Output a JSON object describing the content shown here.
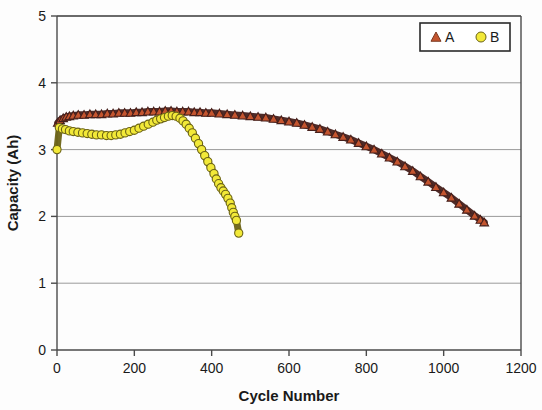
{
  "chart_data": {
    "type": "scatter",
    "title": "",
    "xlabel": "Cycle Number",
    "ylabel": "Capacity (Ah)",
    "xlim": [
      0,
      1200
    ],
    "ylim": [
      0,
      5
    ],
    "xticks": [
      0,
      200,
      400,
      600,
      800,
      1000,
      1200
    ],
    "yticks": [
      0,
      1,
      2,
      3,
      4,
      5
    ],
    "xtick_labels": [
      "0",
      "200",
      "400",
      "600",
      "800",
      "1000",
      "1200"
    ],
    "ytick_labels": [
      "0",
      "1",
      "2",
      "3",
      "4",
      "5"
    ],
    "grid": "horizontal",
    "legend_position": "top-right",
    "series": [
      {
        "name": "A",
        "marker": "triangle",
        "color": "#c4552f",
        "line_color": "#46201c",
        "points": [
          [
            2,
            3.4
          ],
          [
            8,
            3.44
          ],
          [
            16,
            3.47
          ],
          [
            24,
            3.49
          ],
          [
            32,
            3.5
          ],
          [
            42,
            3.51
          ],
          [
            55,
            3.52
          ],
          [
            70,
            3.52
          ],
          [
            85,
            3.53
          ],
          [
            100,
            3.53
          ],
          [
            115,
            3.53
          ],
          [
            130,
            3.54
          ],
          [
            145,
            3.54
          ],
          [
            160,
            3.55
          ],
          [
            175,
            3.55
          ],
          [
            190,
            3.55
          ],
          [
            205,
            3.56
          ],
          [
            220,
            3.56
          ],
          [
            235,
            3.57
          ],
          [
            250,
            3.57
          ],
          [
            265,
            3.57
          ],
          [
            280,
            3.58
          ],
          [
            295,
            3.58
          ],
          [
            310,
            3.57
          ],
          [
            325,
            3.57
          ],
          [
            340,
            3.57
          ],
          [
            355,
            3.56
          ],
          [
            370,
            3.56
          ],
          [
            385,
            3.55
          ],
          [
            400,
            3.55
          ],
          [
            420,
            3.54
          ],
          [
            440,
            3.53
          ],
          [
            460,
            3.52
          ],
          [
            480,
            3.51
          ],
          [
            500,
            3.5
          ],
          [
            520,
            3.49
          ],
          [
            540,
            3.48
          ],
          [
            560,
            3.46
          ],
          [
            580,
            3.44
          ],
          [
            600,
            3.42
          ],
          [
            620,
            3.4
          ],
          [
            640,
            3.37
          ],
          [
            660,
            3.34
          ],
          [
            680,
            3.31
          ],
          [
            700,
            3.27
          ],
          [
            720,
            3.23
          ],
          [
            740,
            3.19
          ],
          [
            760,
            3.15
          ],
          [
            780,
            3.1
          ],
          [
            800,
            3.05
          ],
          [
            820,
            3.0
          ],
          [
            840,
            2.94
          ],
          [
            860,
            2.88
          ],
          [
            880,
            2.82
          ],
          [
            900,
            2.75
          ],
          [
            920,
            2.68
          ],
          [
            940,
            2.6
          ],
          [
            960,
            2.52
          ],
          [
            980,
            2.44
          ],
          [
            1000,
            2.36
          ],
          [
            1020,
            2.28
          ],
          [
            1040,
            2.19
          ],
          [
            1060,
            2.1
          ],
          [
            1080,
            2.01
          ],
          [
            1095,
            1.95
          ],
          [
            1105,
            1.91
          ]
        ]
      },
      {
        "name": "B",
        "marker": "circle",
        "color": "#f2e938",
        "line_color": "#6b6316",
        "points": [
          [
            0,
            3.0
          ],
          [
            6,
            3.33
          ],
          [
            14,
            3.31
          ],
          [
            22,
            3.3
          ],
          [
            32,
            3.28
          ],
          [
            42,
            3.27
          ],
          [
            54,
            3.26
          ],
          [
            66,
            3.25
          ],
          [
            78,
            3.24
          ],
          [
            90,
            3.23
          ],
          [
            102,
            3.22
          ],
          [
            115,
            3.22
          ],
          [
            128,
            3.21
          ],
          [
            140,
            3.21
          ],
          [
            152,
            3.22
          ],
          [
            164,
            3.23
          ],
          [
            176,
            3.25
          ],
          [
            188,
            3.27
          ],
          [
            200,
            3.29
          ],
          [
            212,
            3.32
          ],
          [
            224,
            3.35
          ],
          [
            236,
            3.38
          ],
          [
            248,
            3.41
          ],
          [
            258,
            3.44
          ],
          [
            268,
            3.46
          ],
          [
            278,
            3.48
          ],
          [
            288,
            3.5
          ],
          [
            298,
            3.51
          ],
          [
            308,
            3.5
          ],
          [
            318,
            3.47
          ],
          [
            326,
            3.43
          ],
          [
            334,
            3.38
          ],
          [
            342,
            3.32
          ],
          [
            350,
            3.25
          ],
          [
            358,
            3.17
          ],
          [
            366,
            3.09
          ],
          [
            374,
            3.0
          ],
          [
            382,
            2.91
          ],
          [
            390,
            2.82
          ],
          [
            398,
            2.73
          ],
          [
            406,
            2.64
          ],
          [
            412,
            2.56
          ],
          [
            418,
            2.49
          ],
          [
            424,
            2.43
          ],
          [
            430,
            2.38
          ],
          [
            436,
            2.33
          ],
          [
            442,
            2.27
          ],
          [
            448,
            2.2
          ],
          [
            452,
            2.13
          ],
          [
            456,
            2.06
          ],
          [
            460,
            2.0
          ],
          [
            464,
            1.94
          ],
          [
            470,
            1.75
          ]
        ]
      }
    ],
    "legend": [
      {
        "label": "A",
        "marker": "triangle",
        "color": "#c4552f"
      },
      {
        "label": "B",
        "marker": "circle",
        "color": "#f2e938"
      }
    ]
  }
}
